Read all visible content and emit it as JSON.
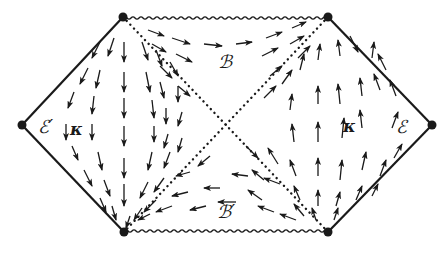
{
  "diagram": {
    "colors": {
      "ink": "#1a1a1a",
      "background": "#ffffff"
    },
    "vertices": {
      "top_left": [
        123,
        17
      ],
      "top_right": [
        328,
        17
      ],
      "left": [
        22,
        125
      ],
      "right": [
        432,
        125
      ],
      "bottom_left": [
        124,
        232
      ],
      "bottom_right": [
        328,
        232
      ],
      "center": [
        226,
        125
      ]
    },
    "labels": {
      "E_prime": {
        "text": "ℰ′",
        "x": 38,
        "y": 133
      },
      "kappa_left": {
        "text": "κ",
        "x": 70,
        "y": 135
      },
      "B": {
        "text": "ℬ",
        "x": 218,
        "y": 68
      },
      "kappa_right": {
        "text": "κ",
        "x": 343,
        "y": 132
      },
      "E": {
        "text": "ℰ",
        "x": 396,
        "y": 133
      },
      "B_prime": {
        "text": "ℬ′",
        "x": 217,
        "y": 218
      }
    },
    "boundaries": {
      "singularity_top": "wavy",
      "singularity_bottom": "wavy",
      "scri": "solid",
      "horizons": "dotted"
    },
    "arrows": [
      [
        100,
        42,
        92,
        58
      ],
      [
        114,
        38,
        108,
        56
      ],
      [
        124,
        42,
        124,
        62
      ],
      [
        142,
        42,
        148,
        60
      ],
      [
        156,
        50,
        162,
        66
      ],
      [
        170,
        62,
        178,
        76
      ],
      [
        88,
        68,
        80,
        84
      ],
      [
        100,
        70,
        96,
        88
      ],
      [
        124,
        72,
        124,
        92
      ],
      [
        146,
        72,
        150,
        92
      ],
      [
        160,
        82,
        164,
        98
      ],
      [
        178,
        86,
        178,
        102
      ],
      [
        74,
        92,
        68,
        108
      ],
      [
        94,
        96,
        92,
        114
      ],
      [
        124,
        98,
        124,
        118
      ],
      [
        152,
        100,
        154,
        118
      ],
      [
        166,
        108,
        166,
        124
      ],
      [
        182,
        112,
        178,
        126
      ],
      [
        66,
        124,
        66,
        140
      ],
      [
        92,
        124,
        92,
        140
      ],
      [
        124,
        126,
        124,
        146
      ],
      [
        154,
        126,
        154,
        142
      ],
      [
        168,
        134,
        164,
        148
      ],
      [
        182,
        138,
        178,
        152
      ],
      [
        72,
        146,
        78,
        160
      ],
      [
        98,
        152,
        102,
        170
      ],
      [
        124,
        158,
        124,
        178
      ],
      [
        152,
        152,
        148,
        170
      ],
      [
        170,
        152,
        164,
        168
      ],
      [
        84,
        170,
        92,
        186
      ],
      [
        104,
        180,
        110,
        196
      ],
      [
        124,
        184,
        124,
        206
      ],
      [
        148,
        182,
        140,
        198
      ],
      [
        164,
        178,
        154,
        192
      ],
      [
        100,
        198,
        106,
        212
      ],
      [
        112,
        206,
        116,
        220
      ],
      [
        142,
        208,
        134,
        220
      ],
      [
        156,
        200,
        144,
        212
      ],
      [
        130,
        216,
        126,
        228
      ],
      [
        148,
        30,
        164,
        36
      ],
      [
        172,
        38,
        190,
        44
      ],
      [
        204,
        44,
        222,
        46
      ],
      [
        236,
        44,
        252,
        42
      ],
      [
        266,
        38,
        282,
        32
      ],
      [
        292,
        28,
        306,
        22
      ],
      [
        152,
        44,
        166,
        52
      ],
      [
        176,
        54,
        192,
        62
      ],
      [
        262,
        56,
        278,
        48
      ],
      [
        290,
        44,
        304,
        36
      ],
      [
        160,
        66,
        172,
        78
      ],
      [
        270,
        76,
        282,
        66
      ],
      [
        298,
        58,
        310,
        46
      ],
      [
        178,
        86,
        190,
        96
      ],
      [
        264,
        98,
        276,
        86
      ],
      [
        350,
        36,
        358,
        52
      ],
      [
        340,
        56,
        338,
        40
      ],
      [
        318,
        60,
        320,
        44
      ],
      [
        300,
        70,
        304,
        54
      ],
      [
        282,
        84,
        292,
        70
      ],
      [
        372,
        58,
        374,
        42
      ],
      [
        386,
        70,
        378,
        54
      ],
      [
        396,
        96,
        390,
        80
      ],
      [
        290,
        110,
        292,
        94
      ],
      [
        318,
        104,
        318,
        86
      ],
      [
        340,
        104,
        338,
        84
      ],
      [
        362,
        96,
        360,
        78
      ],
      [
        380,
        90,
        374,
        74
      ],
      [
        294,
        142,
        292,
        124
      ],
      [
        318,
        142,
        318,
        122
      ],
      [
        342,
        138,
        344,
        118
      ],
      [
        362,
        128,
        360,
        110
      ],
      [
        392,
        128,
        398,
        112
      ],
      [
        296,
        176,
        290,
        160
      ],
      [
        318,
        176,
        318,
        158
      ],
      [
        340,
        180,
        342,
        160
      ],
      [
        362,
        170,
        366,
        152
      ],
      [
        380,
        176,
        386,
        160
      ],
      [
        394,
        158,
        402,
        144
      ],
      [
        278,
        164,
        268,
        148
      ],
      [
        264,
        180,
        252,
        170
      ],
      [
        262,
        200,
        248,
        190
      ],
      [
        300,
        200,
        294,
        186
      ],
      [
        318,
        206,
        318,
        190
      ],
      [
        336,
        206,
        340,
        192
      ],
      [
        356,
        200,
        362,
        186
      ],
      [
        372,
        196,
        378,
        184
      ],
      [
        304,
        216,
        294,
        204
      ],
      [
        316,
        220,
        312,
        208
      ],
      [
        334,
        220,
        338,
        208
      ],
      [
        220,
        188,
        204,
        188
      ],
      [
        248,
        176,
        232,
        174
      ],
      [
        280,
        184,
        264,
        178
      ],
      [
        190,
        172,
        176,
        176
      ],
      [
        188,
        192,
        172,
        196
      ],
      [
        172,
        206,
        156,
        212
      ],
      [
        150,
        214,
        138,
        220
      ],
      [
        206,
        206,
        190,
        210
      ],
      [
        236,
        202,
        218,
        202
      ],
      [
        274,
        212,
        258,
        206
      ],
      [
        296,
        220,
        280,
        214
      ],
      [
        210,
        156,
        198,
        166
      ],
      [
        246,
        146,
        258,
        158
      ]
    ]
  }
}
